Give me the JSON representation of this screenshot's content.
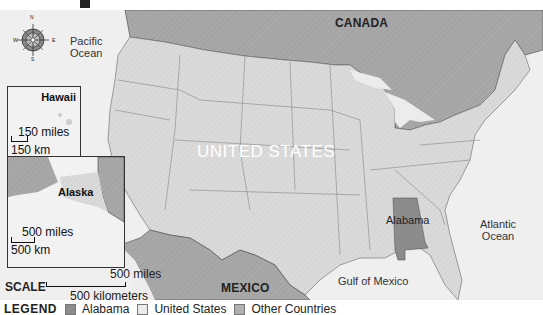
{
  "title_fragment": "p",
  "labels": {
    "canada": "CANADA",
    "mexico": "MEXICO",
    "united_states": "UNITED STATES",
    "alabama": "Alabama",
    "pacific_ocean_line1": "Pacific",
    "pacific_ocean_line2": "Ocean",
    "atlantic_ocean_line1": "Atlantic",
    "atlantic_ocean_line2": "Ocean",
    "gulf_of_mexico": "Gulf of Mexico"
  },
  "compass": {
    "n": "N",
    "s": "S",
    "e": "E",
    "w": "W"
  },
  "insets": {
    "hawaii": {
      "title": "Hawaii",
      "scale_miles": "150 miles",
      "scale_km": "150 km"
    },
    "alaska": {
      "title": "Alaska",
      "scale_miles": "500 miles",
      "scale_km": "500 km"
    }
  },
  "scale": {
    "label": "SCALE",
    "miles": "500 miles",
    "kilometers": "500 kilometers"
  },
  "legend": {
    "title": "LEGEND",
    "items": [
      {
        "label": "Alabama",
        "color": "#8a8a8a"
      },
      {
        "label": "United States",
        "color": "#e0e0e0"
      },
      {
        "label": "Other Countries",
        "color": "#a9a9a9"
      }
    ]
  },
  "colors": {
    "water": "#efefef",
    "us": "#d9d9d9",
    "other": "#a6a6a6",
    "alabama": "#8c8c8c",
    "border": "#555555"
  }
}
